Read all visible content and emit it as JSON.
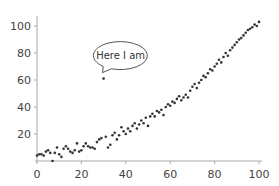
{
  "chart_data": {
    "type": "scatter",
    "title": "",
    "xlabel": "",
    "ylabel": "",
    "xlim": [
      0,
      100
    ],
    "ylim": [
      0,
      105
    ],
    "grid": false,
    "legend": null,
    "x_ticks": [
      0,
      20,
      40,
      60,
      80,
      100
    ],
    "y_ticks": [
      20,
      40,
      60,
      80,
      100
    ],
    "colors": {
      "points": "#333333",
      "axis": "#a8a8a8",
      "labels": "#444444"
    },
    "annotation": {
      "text": "Here I am",
      "x": 30,
      "y": 61,
      "style": "speech-bubble"
    },
    "series": [
      {
        "name": "data",
        "points": [
          [
            0,
            4
          ],
          [
            1,
            5
          ],
          [
            2,
            5
          ],
          [
            3,
            4
          ],
          [
            4,
            7
          ],
          [
            5,
            8
          ],
          [
            6,
            6
          ],
          [
            7,
            0
          ],
          [
            8,
            6
          ],
          [
            9,
            10
          ],
          [
            10,
            5
          ],
          [
            11,
            3
          ],
          [
            12,
            9
          ],
          [
            13,
            11
          ],
          [
            14,
            9
          ],
          [
            15,
            7
          ],
          [
            16,
            6
          ],
          [
            17,
            8
          ],
          [
            18,
            13
          ],
          [
            19,
            7
          ],
          [
            20,
            8
          ],
          [
            21,
            11
          ],
          [
            22,
            13
          ],
          [
            23,
            11
          ],
          [
            24,
            10
          ],
          [
            25,
            10
          ],
          [
            26,
            9
          ],
          [
            27,
            14
          ],
          [
            28,
            16
          ],
          [
            29,
            17
          ],
          [
            30,
            61
          ],
          [
            31,
            18
          ],
          [
            32,
            10
          ],
          [
            33,
            12
          ],
          [
            34,
            19
          ],
          [
            35,
            21
          ],
          [
            36,
            16
          ],
          [
            37,
            19
          ],
          [
            38,
            25
          ],
          [
            39,
            22
          ],
          [
            40,
            20
          ],
          [
            41,
            24
          ],
          [
            42,
            22
          ],
          [
            43,
            26
          ],
          [
            44,
            28
          ],
          [
            45,
            24
          ],
          [
            46,
            27
          ],
          [
            47,
            30
          ],
          [
            48,
            28
          ],
          [
            49,
            32
          ],
          [
            50,
            26
          ],
          [
            51,
            33
          ],
          [
            52,
            35
          ],
          [
            53,
            33
          ],
          [
            54,
            37
          ],
          [
            55,
            36
          ],
          [
            56,
            38
          ],
          [
            57,
            34
          ],
          [
            58,
            40
          ],
          [
            59,
            42
          ],
          [
            60,
            41
          ],
          [
            61,
            44
          ],
          [
            62,
            43
          ],
          [
            63,
            46
          ],
          [
            64,
            48
          ],
          [
            65,
            45
          ],
          [
            66,
            47
          ],
          [
            67,
            49
          ],
          [
            68,
            47
          ],
          [
            69,
            52
          ],
          [
            70,
            55
          ],
          [
            71,
            57
          ],
          [
            72,
            54
          ],
          [
            73,
            58
          ],
          [
            74,
            60
          ],
          [
            75,
            63
          ],
          [
            76,
            62
          ],
          [
            77,
            65
          ],
          [
            78,
            68
          ],
          [
            79,
            67
          ],
          [
            80,
            70
          ],
          [
            81,
            72
          ],
          [
            82,
            75
          ],
          [
            83,
            73
          ],
          [
            84,
            77
          ],
          [
            85,
            80
          ],
          [
            86,
            78
          ],
          [
            87,
            82
          ],
          [
            88,
            84
          ],
          [
            89,
            86
          ],
          [
            90,
            88
          ],
          [
            91,
            90
          ],
          [
            92,
            91
          ],
          [
            93,
            93
          ],
          [
            94,
            95
          ],
          [
            95,
            97
          ],
          [
            96,
            98
          ],
          [
            97,
            99
          ],
          [
            98,
            101
          ],
          [
            99,
            100
          ],
          [
            100,
            103
          ]
        ]
      }
    ]
  }
}
